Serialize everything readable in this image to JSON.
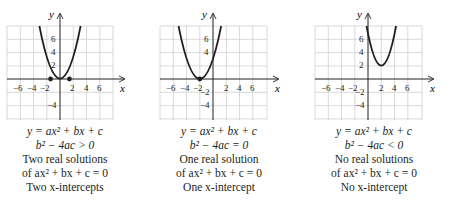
{
  "panels": [
    {
      "equation": "y = ax² + bx + c",
      "discriminant": "b² − 4ac > 0",
      "solutions_line1": "Two real solutions",
      "solutions_line2": "of ax² + bx + c = 0",
      "intercepts": "Two x-intercepts",
      "curve": "y = x² − 2",
      "vertex": [
        0,
        -2
      ],
      "x_intercepts": [
        -1.41,
        1.41
      ]
    },
    {
      "equation": "y = ax² + bx + c",
      "discriminant": "b² − 4ac = 0",
      "solutions_line1": "One real solution",
      "solutions_line2": "of ax² + bx + c = 0",
      "intercepts": "One x-intercept",
      "curve": "y = (x + 2)²",
      "vertex": [
        -2,
        0
      ],
      "x_intercepts": [
        -2
      ]
    },
    {
      "equation": "y = ax² + bx + c",
      "discriminant": "b² − 4ac < 0",
      "solutions_line1": "No real solutions",
      "solutions_line2": "of ax² + bx + c = 0",
      "intercepts": "No x-intercept",
      "curve": "y = (x − 2)² + 2",
      "vertex": [
        2,
        2
      ],
      "x_intercepts": []
    }
  ],
  "axes": {
    "x_label": "x",
    "y_label": "y",
    "x_ticks": [
      "−6",
      "−4",
      "−2",
      "2",
      "4",
      "6"
    ],
    "y_ticks_panel1": [
      "6",
      "4",
      "2",
      "−4"
    ],
    "y_ticks_panel2": [
      "6",
      "4",
      "−2",
      "−4"
    ],
    "y_ticks_panel3": [
      "6",
      "4",
      "2",
      "−2",
      "−4"
    ]
  },
  "colors": {
    "grid": "#cfcfcf",
    "axis": "#231f20",
    "curve": "#231f20"
  }
}
